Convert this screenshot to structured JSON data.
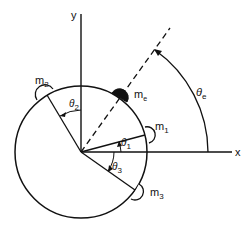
{
  "diagram": {
    "axes": {
      "x_label": "x",
      "y_label": "y"
    },
    "masses": [
      {
        "id": "m1",
        "label": "m",
        "sub": "1",
        "angle_label": "θ",
        "angle_sub": "1",
        "style": "open"
      },
      {
        "id": "m2",
        "label": "m",
        "sub": "2",
        "angle_label": "θ",
        "angle_sub": "2",
        "style": "open"
      },
      {
        "id": "m3",
        "label": "m",
        "sub": "3",
        "angle_label": "θ",
        "angle_sub": "3",
        "style": "open"
      },
      {
        "id": "me",
        "label": "m",
        "sub": "e",
        "angle_label": "θ",
        "angle_sub": "e",
        "style": "filled"
      }
    ],
    "colors": {
      "stroke": "#111111",
      "background": "#ffffff",
      "filled_mass": "#111111"
    }
  }
}
